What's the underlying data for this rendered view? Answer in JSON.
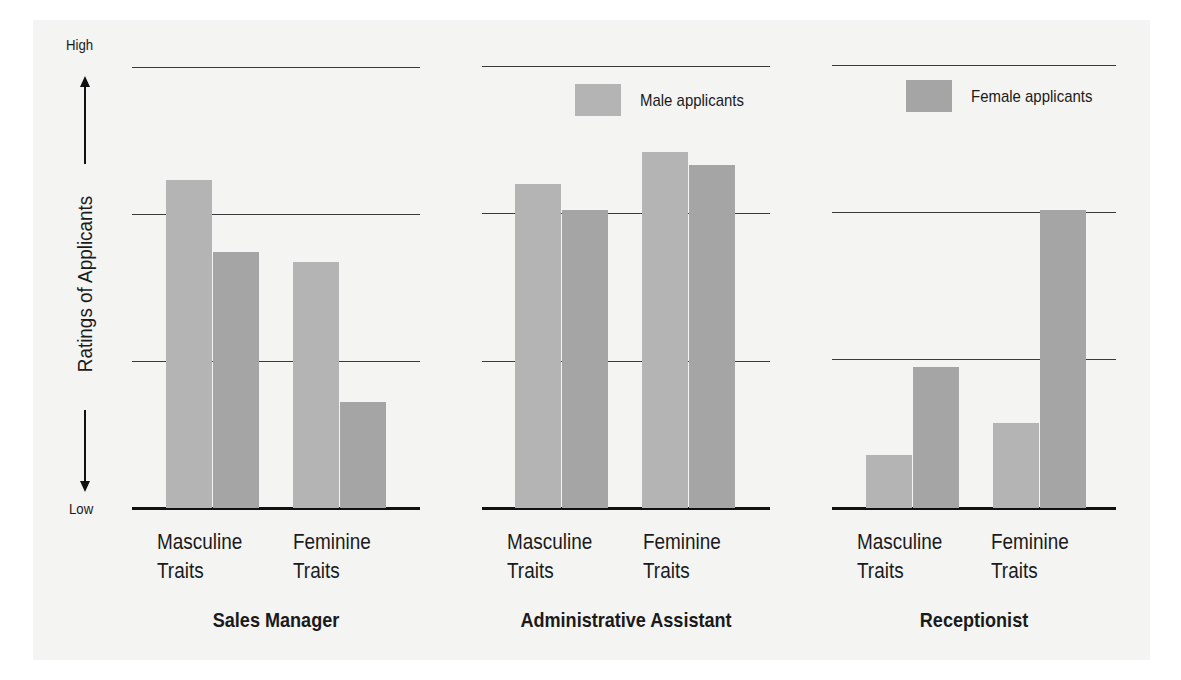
{
  "chart_data": {
    "type": "bar",
    "title": "",
    "ylabel": "Ratings of Applicants",
    "xlabel": "",
    "ytick_labels": {
      "high": "High",
      "low": "Low"
    },
    "ylim": [
      0,
      3
    ],
    "grid": true,
    "legend_position": "top-right",
    "series_names": [
      "Male applicants",
      "Female applicants"
    ],
    "colors": {
      "male": "#b4b4b4",
      "female": "#a5a5a5"
    },
    "groups": [
      {
        "title": "Sales Manager",
        "categories": [
          "Masculine Traits",
          "Feminine Traits"
        ],
        "series": [
          {
            "name": "Male applicants",
            "values": [
              2.23,
              1.67
            ]
          },
          {
            "name": "Female applicants",
            "values": [
              1.74,
              0.72
            ]
          }
        ]
      },
      {
        "title": "Administrative Assistant",
        "categories": [
          "Masculine Traits",
          "Feminine Traits"
        ],
        "series": [
          {
            "name": "Male applicants",
            "values": [
              2.2,
              2.42
            ]
          },
          {
            "name": "Female applicants",
            "values": [
              2.02,
              2.33
            ]
          }
        ]
      },
      {
        "title": "Receptionist",
        "categories": [
          "Masculine Traits",
          "Feminine Traits"
        ],
        "series": [
          {
            "name": "Male applicants",
            "values": [
              0.36,
              0.58
            ]
          },
          {
            "name": "Female applicants",
            "values": [
              0.96,
              2.02
            ]
          }
        ]
      }
    ]
  },
  "labels": {
    "yaxis": "Ratings of Applicants",
    "high": "High",
    "low": "Low",
    "legend_male": "Male applicants",
    "legend_female": "Female applicants",
    "cat1_line1": "Masculine",
    "cat1_line2": "Traits",
    "cat2_line1": "Feminine",
    "cat2_line2": "Traits",
    "group1": "Sales Manager",
    "group2": "Administrative Assistant",
    "group3": "Receptionist"
  }
}
